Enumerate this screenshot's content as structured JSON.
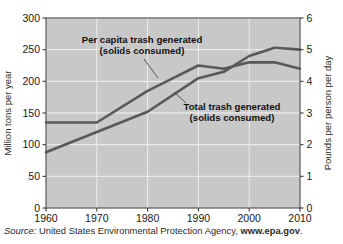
{
  "figure": {
    "plot": {
      "bg_color": "#c8c8c8",
      "grid_color": "#eeeeee",
      "border_color": "#5a5a5a",
      "line_color": "#595959"
    },
    "left_axis": {
      "label": "Million tons per year",
      "ticks": [
        "0",
        "50",
        "100",
        "150",
        "200",
        "250",
        "300"
      ],
      "min": 0,
      "max": 300
    },
    "right_axis": {
      "label": "Pounds per person per day",
      "ticks": [
        "0",
        "1",
        "2",
        "3",
        "4",
        "5",
        "6"
      ],
      "min": 0,
      "max": 6
    },
    "x_axis": {
      "label": "",
      "ticks": [
        "1960",
        "1970",
        "1980",
        "1990",
        "2000",
        "2010"
      ],
      "min": 1960,
      "max": 2010
    },
    "annotations": [
      {
        "name": "per-capita-label",
        "line1": "Per capita trash generated",
        "line2": "(solids consumed)"
      },
      {
        "name": "total-trash-label",
        "line1": "Total trash generated",
        "line2": "(solids consumed)"
      }
    ]
  },
  "source": {
    "prefix": "Source:",
    "agency": "United States Environmental Protection Agency,",
    "url": "www.epa.gov",
    "suffix": "."
  },
  "chart_data": {
    "type": "line",
    "title": "",
    "xlabel": "",
    "ylabel": "Million tons per year",
    "y2label": "Pounds per person per day",
    "xlim": [
      1960,
      2010
    ],
    "ylim": [
      0,
      300
    ],
    "y2lim": [
      0,
      6
    ],
    "grid": true,
    "legend": "annotated-inline",
    "x": [
      1960,
      1970,
      1980,
      1990,
      1995,
      2000,
      2005,
      2010
    ],
    "xticks": [
      1960,
      1970,
      1980,
      1990,
      2000,
      2010
    ],
    "yticks": [
      0,
      50,
      100,
      150,
      200,
      250,
      300
    ],
    "y2ticks": [
      0,
      1,
      2,
      3,
      4,
      5,
      6
    ],
    "series": [
      {
        "name": "Per capita trash generated (solids consumed)",
        "axis": "right",
        "units": "pounds per person per day",
        "x": [
          1960,
          1970,
          1980,
          1990,
          1995,
          2000,
          2005,
          2010
        ],
        "values": [
          2.7,
          2.7,
          3.7,
          4.5,
          4.4,
          4.6,
          4.6,
          4.4
        ]
      },
      {
        "name": "Total trash generated (solids consumed)",
        "axis": "left",
        "units": "million tons per year",
        "x": [
          1960,
          1970,
          1980,
          1990,
          1995,
          2000,
          2005,
          2010
        ],
        "values": [
          88,
          120,
          152,
          205,
          215,
          240,
          253,
          250
        ]
      }
    ]
  }
}
